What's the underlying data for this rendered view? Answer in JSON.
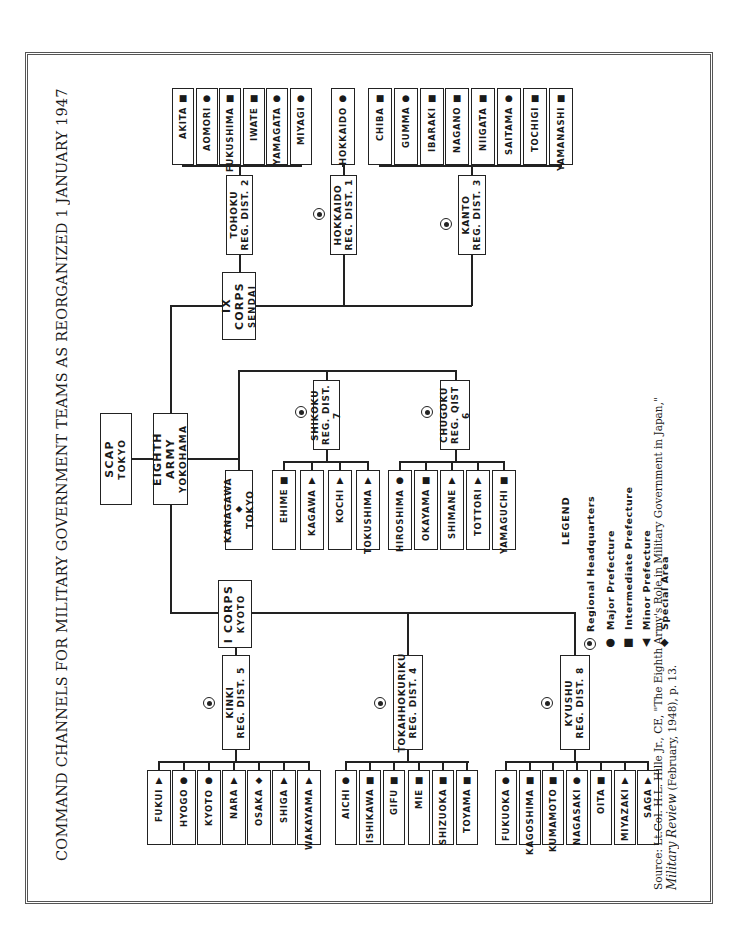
{
  "title": "COMMAND CHANNELS FOR MILITARY GOVERNMENT TEAMS AS REORGANIZED 1 JANUARY 1947",
  "orientation": "page rotated 90° counter-clockwise (text reads bottom-to-top)",
  "top": {
    "scap": {
      "line1": "SCAP",
      "line2": "TOKYO"
    },
    "eighth_army": {
      "line1": "EIGHTH ARMY",
      "line2": "YOKOHAMA"
    }
  },
  "corps": {
    "ix": {
      "line1": "IX CORPS",
      "line2": "SENDAI"
    },
    "i": {
      "line1": "I CORPS",
      "line2": "KYOTO"
    }
  },
  "special": {
    "kanagawa": {
      "line1": "KANAGAWA",
      "line2": "TOKYO",
      "symbol": "diamond"
    }
  },
  "districts": {
    "tohoku": {
      "line1": "TOHOKU",
      "line2": "REG. DIST. 2",
      "prefectures": [
        {
          "name": "AKITA",
          "symbol": "square"
        },
        {
          "name": "AOMORI",
          "symbol": "circle"
        },
        {
          "name": "FUKUSHIMA",
          "symbol": "square"
        },
        {
          "name": "IWATE",
          "symbol": "square"
        },
        {
          "name": "YAMAGATA",
          "symbol": "circle"
        },
        {
          "name": "MIYAGI",
          "symbol": "circle"
        }
      ]
    },
    "hokkaido": {
      "line1": "HOKKAIDO",
      "line2": "REG. DIST. 1",
      "prefectures": [
        {
          "name": "HOKKAIDO",
          "symbol": "circle"
        }
      ]
    },
    "kanto": {
      "line1": "KANTO",
      "line2": "REG. DIST. 3",
      "prefectures": [
        {
          "name": "CHIBA",
          "symbol": "square"
        },
        {
          "name": "GUMMA",
          "symbol": "circle"
        },
        {
          "name": "IBARAKI",
          "symbol": "square"
        },
        {
          "name": "NAGANO",
          "symbol": "square"
        },
        {
          "name": "NIIGATA",
          "symbol": "square"
        },
        {
          "name": "SAITAMA",
          "symbol": "circle"
        },
        {
          "name": "TOCHIGI",
          "symbol": "square"
        },
        {
          "name": "YAMANASHI",
          "symbol": "square"
        }
      ]
    },
    "shikoku": {
      "line1": "SHIKOKU",
      "line2": "REG. DIST. 7",
      "prefectures": [
        {
          "name": "EHIME",
          "symbol": "square"
        },
        {
          "name": "KAGAWA",
          "symbol": "triangle"
        },
        {
          "name": "KOCHI",
          "symbol": "triangle"
        },
        {
          "name": "TOKUSHIMA",
          "symbol": "triangle"
        }
      ]
    },
    "chugoku": {
      "line1": "CHUGOKU",
      "line2": "REG. QIST 6",
      "prefectures": [
        {
          "name": "HIROSHIMA",
          "symbol": "circle"
        },
        {
          "name": "OKAYAMA",
          "symbol": "square"
        },
        {
          "name": "SHIMANE",
          "symbol": "triangle"
        },
        {
          "name": "TOTTORI",
          "symbol": "triangle"
        },
        {
          "name": "YAMAGUCHI",
          "symbol": "square"
        }
      ]
    },
    "kinki": {
      "line1": "KINKI",
      "line2": "REG. DIST. 5",
      "prefectures": [
        {
          "name": "FUKUI",
          "symbol": "triangle"
        },
        {
          "name": "HYOGO",
          "symbol": "circle"
        },
        {
          "name": "KYOTO",
          "symbol": "circle"
        },
        {
          "name": "NARA",
          "symbol": "triangle"
        },
        {
          "name": "OSAKA",
          "symbol": "diamond"
        },
        {
          "name": "SHIGA",
          "symbol": "triangle"
        },
        {
          "name": "WAKAYAMA",
          "symbol": "triangle"
        }
      ]
    },
    "tokahhokuriku": {
      "line1": "TOKAHHOKURIKU",
      "line2": "REG. DIST. 4",
      "prefectures": [
        {
          "name": "AICHI",
          "symbol": "circle"
        },
        {
          "name": "ISHIKAWA",
          "symbol": "square"
        },
        {
          "name": "GIFU",
          "symbol": "square"
        },
        {
          "name": "MIE",
          "symbol": "square"
        },
        {
          "name": "SHIZUOKA",
          "symbol": "square"
        },
        {
          "name": "TOYAMA",
          "symbol": "square"
        }
      ]
    },
    "kyushu": {
      "line1": "KYUSHU",
      "line2": "REG. DIST. 8",
      "prefectures": [
        {
          "name": "FUKUOKA",
          "symbol": "circle"
        },
        {
          "name": "KAGOSHIMA",
          "symbol": "square"
        },
        {
          "name": "KUMAMOTO",
          "symbol": "square"
        },
        {
          "name": "NAGASAKI",
          "symbol": "circle"
        },
        {
          "name": "OITA",
          "symbol": "square"
        },
        {
          "name": "MIYAZAKI",
          "symbol": "triangle"
        },
        {
          "name": "SAGA",
          "symbol": "triangle"
        }
      ]
    }
  },
  "legend": {
    "title": "LEGEND",
    "items": [
      {
        "symbol": "regional-hq",
        "label": "Regional Headquarters"
      },
      {
        "symbol": "circle",
        "label": "Major Prefecture"
      },
      {
        "symbol": "square",
        "label": "Intermediate Prefecture"
      },
      {
        "symbol": "triangle",
        "label": "Minor Prefecture"
      },
      {
        "symbol": "diamond",
        "label": "Special Area"
      }
    ]
  },
  "source": {
    "line1": "Source: Lt.Col. H.L. Hille Jr., CE, \"The Eighth Army's Role in Military Government in Japan,\"",
    "line2_italic": "Military Review",
    "line2_rest": " (February, 1948), p. 13."
  }
}
